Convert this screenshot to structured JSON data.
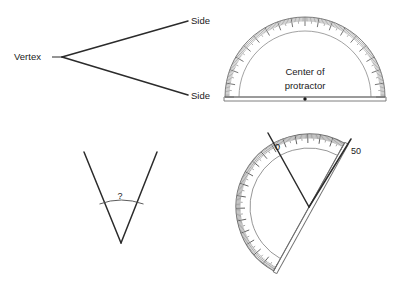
{
  "page": {
    "background_color": "#ffffff",
    "width": 409,
    "height": 308,
    "ink_color": "#2b2b2b",
    "instrument_color": "#6f6f6f"
  },
  "panels": {
    "top_left": {
      "name": "angle-parts-diagram",
      "labels": {
        "vertex": "Vertex",
        "side_upper": "Side",
        "side_lower": "Side"
      },
      "geometry": {
        "vertex_point": [
          62,
          57
        ],
        "ray_upper_end": [
          188,
          21
        ],
        "ray_lower_end": [
          188,
          95
        ],
        "leader_line": [
          [
            52,
            57
          ],
          [
            62,
            57
          ]
        ]
      }
    },
    "top_right": {
      "name": "protractor-diagram",
      "labels": {
        "center_line1": "Center of",
        "center_line2": "protractor"
      },
      "geometry": {
        "center": [
          305,
          97
        ],
        "outer_radius": 80,
        "inner_radius": 66,
        "baseline_left": [
          225,
          97
        ],
        "baseline_right": [
          385,
          97
        ],
        "tick_count_major": 19,
        "tick_count_minor": 180,
        "degrees_span": 180
      }
    },
    "bottom_left": {
      "name": "unknown-angle-diagram",
      "labels": {
        "question": "?"
      },
      "geometry": {
        "vertex_point": [
          121,
          243
        ],
        "ray_left_end": [
          84,
          152
        ],
        "ray_right_end": [
          157,
          152
        ],
        "arc_radius": 58,
        "question_label_pos": [
          120,
          198
        ]
      }
    },
    "bottom_right": {
      "name": "protractor-measuring-angle-diagram",
      "labels": {
        "zero_mark": "0",
        "fifty_mark": "50"
      },
      "geometry": {
        "vertex_point": [
          309,
          207
        ],
        "ray_left_end": [
          268,
          134
        ],
        "ray_right_end": [
          350,
          140
        ],
        "protractor_center": [
          309,
          207
        ],
        "protractor_rotation_deg": -61,
        "outer_radius": 73,
        "inner_radius": 59,
        "zero_label_pos": [
          277,
          147
        ],
        "fifty_label_pos": [
          352,
          151
        ]
      }
    }
  }
}
